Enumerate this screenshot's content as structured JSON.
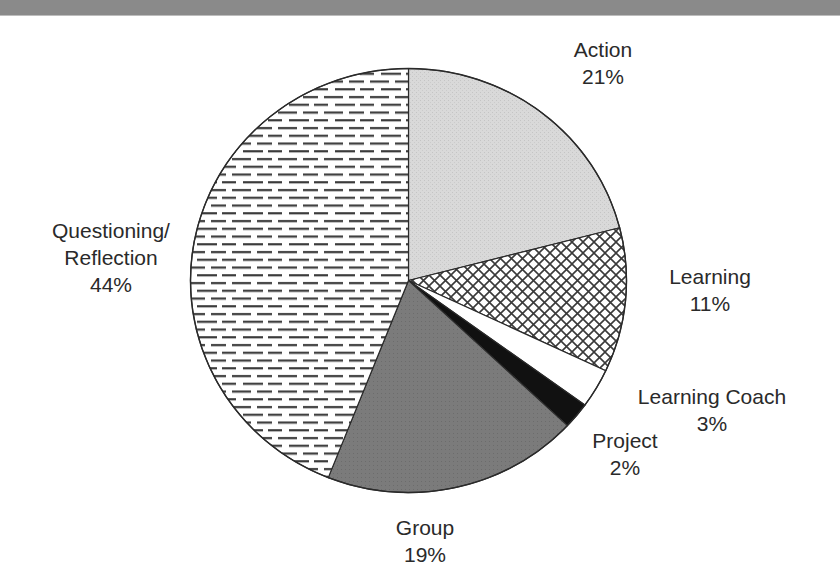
{
  "chart_data": {
    "type": "pie",
    "title": "",
    "categories": [
      "Action",
      "Learning",
      "Learning Coach",
      "Project",
      "Group",
      "Questioning/ Reflection"
    ],
    "values": [
      21,
      11,
      3,
      2,
      19,
      44
    ],
    "unit": "%",
    "start_angle_deg": 0,
    "direction": "clockwise",
    "slices": [
      {
        "label": "Action",
        "value": 21,
        "display": "21%",
        "fill": "light-gray-stipple",
        "color": "#d6d6d6"
      },
      {
        "label": "Learning",
        "value": 11,
        "display": "11%",
        "fill": "diagonal-crosshatch",
        "color": "#444444"
      },
      {
        "label": "Learning Coach",
        "value": 3,
        "display": "3%",
        "fill": "white",
        "color": "#ffffff"
      },
      {
        "label": "Project",
        "value": 2,
        "display": "2%",
        "fill": "black",
        "color": "#111111"
      },
      {
        "label": "Group",
        "value": 19,
        "display": "19%",
        "fill": "dark-gray",
        "color": "#7a7a7a"
      },
      {
        "label": "Questioning/ Reflection",
        "value": 44,
        "display": "44%",
        "fill": "horizontal-dashes",
        "color": "#333333"
      }
    ],
    "legend": "none (direct labels)"
  },
  "labels": {
    "action": {
      "name": "Action",
      "pct": "21%"
    },
    "learning": {
      "name": "Learning",
      "pct": "11%"
    },
    "learning_coach": {
      "name": "Learning Coach",
      "pct": "3%"
    },
    "project": {
      "name": "Project",
      "pct": "2%"
    },
    "group": {
      "name": "Group",
      "pct": "19%"
    },
    "questioning": {
      "name_line1": "Questioning/",
      "name_line2": "Reflection",
      "pct": "44%"
    }
  }
}
